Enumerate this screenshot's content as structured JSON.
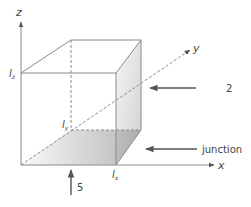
{
  "diagram": {
    "type": "3d-cube-coordinate-system",
    "axes": {
      "x": {
        "label": "x"
      },
      "y": {
        "label": "y"
      },
      "z": {
        "label": "z"
      }
    },
    "dimension_labels": {
      "lz": "l",
      "lz_sub": "z",
      "ly": "l",
      "ly_sub": "y",
      "lx": "l",
      "lx_sub": "x"
    },
    "annotations": [
      {
        "id": "arrow-2",
        "label": "2",
        "direction": "left"
      },
      {
        "id": "arrow-junction",
        "label": "junction",
        "direction": "left"
      },
      {
        "id": "arrow-5",
        "label": "5",
        "direction": "up"
      }
    ],
    "colors": {
      "line": "#8a8a8a",
      "text": "#444444",
      "shade_dark": "#b9b9b9",
      "shade_light": "#f4f4f4"
    }
  }
}
